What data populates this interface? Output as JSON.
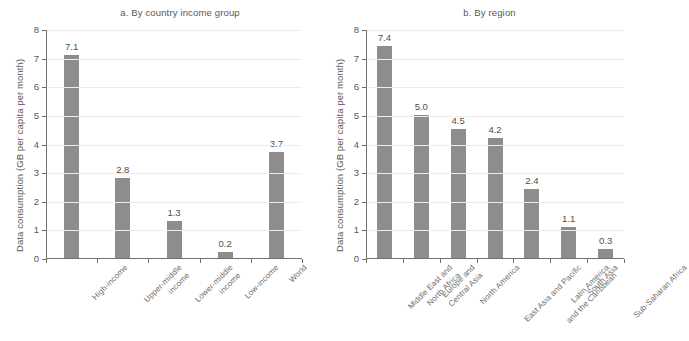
{
  "figure": {
    "cut_off_header": "",
    "bar_color": "#8d8d8d",
    "axis_color": "#6f6f70",
    "grid_color": "#ececed",
    "background": "#ffffff"
  },
  "panels": [
    {
      "id": "a",
      "title": "a. By country income group",
      "ylabel": "Data consumption (GB per capita per month)"
    },
    {
      "id": "b",
      "title": "b. By region",
      "ylabel": "Data consumption (GB per capita per month)"
    }
  ],
  "yticks": [
    "8",
    "7",
    "6",
    "5",
    "4",
    "3",
    "2",
    "1",
    "0"
  ],
  "chart_data": [
    {
      "type": "bar",
      "title": "a. By country income group",
      "xlabel": "",
      "ylabel": "Data consumption (GB per capita per month)",
      "ylim": [
        0,
        8
      ],
      "ytick_values": [
        0,
        1,
        2,
        3,
        4,
        5,
        6,
        7,
        8
      ],
      "grid": "horizontal",
      "legend": "none",
      "categories": [
        "High-income",
        "Upper-middle income",
        "Lower-middle income",
        "Low-income",
        "World"
      ],
      "category_lines": [
        [
          "High-income"
        ],
        [
          "Upper-middle",
          "income"
        ],
        [
          "Lower-middle",
          "income"
        ],
        [
          "Low-income"
        ],
        [
          "World"
        ]
      ],
      "values": [
        7.1,
        2.8,
        1.3,
        0.2,
        3.7
      ],
      "data_labels": [
        "7.1",
        "2.8",
        "1.3",
        "0.2",
        "3.7"
      ]
    },
    {
      "type": "bar",
      "title": "b. By region",
      "xlabel": "",
      "ylabel": "Data consumption (GB per capita per month)",
      "ylim": [
        0,
        8
      ],
      "ytick_values": [
        0,
        1,
        2,
        3,
        4,
        5,
        6,
        7,
        8
      ],
      "grid": "horizontal",
      "legend": "none",
      "categories": [
        "Middle East and North Africa",
        "Europe and Central Asia",
        "North America",
        "East Asia and Pacific",
        "Latin America and the Caribbean",
        "South Asia",
        "Sub-Saharan Africa"
      ],
      "category_lines": [
        [
          "Middle East and",
          "North Africa"
        ],
        [
          "Europe and",
          "Central Asia"
        ],
        [
          "North America"
        ],
        [
          "East Asia and Pacific"
        ],
        [
          "Latin America",
          "and the Caribbean"
        ],
        [
          "South Asia"
        ],
        [
          "Sub-Saharan Africa"
        ]
      ],
      "values": [
        7.4,
        5.0,
        4.5,
        4.2,
        2.4,
        1.1,
        0.3
      ],
      "data_labels": [
        "7.4",
        "5.0",
        "4.5",
        "4.2",
        "2.4",
        "1.1",
        "0.3"
      ]
    }
  ]
}
